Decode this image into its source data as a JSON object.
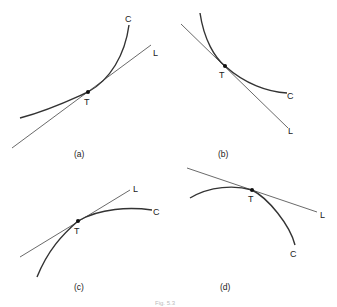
{
  "figure": {
    "caption": "Fig. 5.3",
    "panels": [
      {
        "id": "a",
        "label": "(a)",
        "curve_label": "C",
        "line_label": "L",
        "point_label": "T",
        "description": "Curve concave up, tangent line below curve"
      },
      {
        "id": "b",
        "label": "(b)",
        "curve_label": "C",
        "line_label": "L",
        "point_label": "T",
        "description": "Decreasing curve concave up, tangent line below curve"
      },
      {
        "id": "c",
        "label": "(c)",
        "curve_label": "C",
        "line_label": "L",
        "point_label": "T",
        "description": "Curve concave down, tangent line above curve"
      },
      {
        "id": "d",
        "label": "(d)",
        "curve_label": "C",
        "line_label": "L",
        "point_label": "T",
        "description": "Curve concave down, tangent line above curve"
      }
    ]
  }
}
